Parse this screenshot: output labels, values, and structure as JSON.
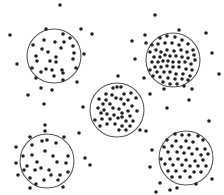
{
  "diagram": {
    "type": "cluster-sampling-illustration",
    "colors": {
      "background": "#ffffff",
      "circle_stroke": "#555555",
      "dot": "#222222"
    },
    "dot_radius": 1.8,
    "clusters": [
      {
        "name": "top-left",
        "cx": 54,
        "cy": 56,
        "r": 27,
        "density": "sparse",
        "dots": [
          [
            46,
            29
          ],
          [
            63,
            34
          ],
          [
            70,
            38
          ],
          [
            44,
            40
          ],
          [
            55,
            42
          ],
          [
            64,
            42
          ],
          [
            33,
            45
          ],
          [
            42,
            49
          ],
          [
            48,
            52
          ],
          [
            61,
            48
          ],
          [
            73,
            46
          ],
          [
            74,
            53
          ],
          [
            36,
            56
          ],
          [
            37,
            61
          ],
          [
            50,
            61
          ],
          [
            56,
            57
          ],
          [
            73,
            59
          ],
          [
            56,
            62
          ],
          [
            32,
            68
          ],
          [
            46,
            69
          ],
          [
            52,
            70
          ],
          [
            62,
            70
          ],
          [
            76,
            68
          ],
          [
            41,
            72
          ],
          [
            63,
            73
          ],
          [
            54,
            76
          ]
        ]
      },
      {
        "name": "top-right",
        "cx": 173,
        "cy": 60,
        "r": 27,
        "density": "dense",
        "dots": [
          [
            160,
            38
          ],
          [
            167,
            36
          ],
          [
            175,
            37
          ],
          [
            182,
            40
          ],
          [
            152,
            45
          ],
          [
            158,
            44
          ],
          [
            165,
            43
          ],
          [
            172,
            43
          ],
          [
            179,
            45
          ],
          [
            188,
            44
          ],
          [
            193,
            50
          ],
          [
            150,
            52
          ],
          [
            156,
            50
          ],
          [
            161,
            52
          ],
          [
            167,
            50
          ],
          [
            174,
            51
          ],
          [
            181,
            50
          ],
          [
            187,
            52
          ],
          [
            194,
            55
          ],
          [
            154,
            57
          ],
          [
            160,
            57
          ],
          [
            165,
            55
          ],
          [
            170,
            56
          ],
          [
            176,
            56
          ],
          [
            182,
            57
          ],
          [
            188,
            58
          ],
          [
            195,
            60
          ],
          [
            152,
            62
          ],
          [
            158,
            62
          ],
          [
            163,
            61
          ],
          [
            168,
            61
          ],
          [
            173,
            62
          ],
          [
            179,
            62
          ],
          [
            185,
            62
          ],
          [
            191,
            64
          ],
          [
            155,
            67
          ],
          [
            161,
            67
          ],
          [
            167,
            66
          ],
          [
            173,
            67
          ],
          [
            179,
            67
          ],
          [
            186,
            69
          ],
          [
            192,
            70
          ],
          [
            150,
            70
          ],
          [
            157,
            72
          ],
          [
            164,
            72
          ],
          [
            170,
            72
          ],
          [
            176,
            74
          ],
          [
            183,
            74
          ],
          [
            190,
            76
          ],
          [
            153,
            76
          ],
          [
            160,
            77
          ],
          [
            168,
            78
          ],
          [
            175,
            79
          ],
          [
            182,
            79
          ],
          [
            188,
            80
          ],
          [
            163,
            82
          ],
          [
            170,
            84
          ],
          [
            177,
            84
          ],
          [
            184,
            86
          ]
        ]
      },
      {
        "name": "center",
        "cx": 117,
        "cy": 110,
        "r": 27,
        "density": "medium",
        "dots": [
          [
            113,
            88
          ],
          [
            117,
            87
          ],
          [
            121,
            87
          ],
          [
            106,
            94
          ],
          [
            112,
            95
          ],
          [
            124,
            94
          ],
          [
            131,
            93
          ],
          [
            99,
            99
          ],
          [
            106,
            100
          ],
          [
            116,
            98
          ],
          [
            121,
            99
          ],
          [
            128,
            100
          ],
          [
            136,
            98
          ],
          [
            103,
            104
          ],
          [
            110,
            104
          ],
          [
            124,
            104
          ],
          [
            132,
            106
          ],
          [
            98,
            108
          ],
          [
            104,
            110
          ],
          [
            113,
            108
          ],
          [
            119,
            109
          ],
          [
            128,
            111
          ],
          [
            137,
            111
          ],
          [
            101,
            113
          ],
          [
            107,
            114
          ],
          [
            114,
            115
          ],
          [
            122,
            113
          ],
          [
            130,
            116
          ],
          [
            102,
            119
          ],
          [
            110,
            119
          ],
          [
            118,
            118
          ],
          [
            126,
            121
          ],
          [
            133,
            121
          ],
          [
            107,
            124
          ],
          [
            115,
            124
          ],
          [
            122,
            126
          ],
          [
            130,
            126
          ],
          [
            100,
            126
          ],
          [
            119,
            130
          ],
          [
            126,
            130
          ]
        ]
      },
      {
        "name": "bottom-left",
        "cx": 47,
        "cy": 161,
        "r": 27,
        "density": "sparse",
        "dots": [
          [
            30,
            137
          ],
          [
            42,
            141
          ],
          [
            47,
            140
          ],
          [
            56,
            143
          ],
          [
            64,
            137
          ],
          [
            32,
            145
          ],
          [
            23,
            156
          ],
          [
            32,
            155
          ],
          [
            45,
            151
          ],
          [
            53,
            156
          ],
          [
            68,
            156
          ],
          [
            27,
            166
          ],
          [
            37,
            162
          ],
          [
            57,
            162
          ],
          [
            66,
            163
          ],
          [
            24,
            170
          ],
          [
            35,
            170
          ],
          [
            41,
            168
          ],
          [
            49,
            170
          ],
          [
            51,
            175
          ],
          [
            60,
            175
          ],
          [
            68,
            172
          ],
          [
            30,
            178
          ],
          [
            44,
            180
          ],
          [
            58,
            180
          ],
          [
            36,
            184
          ]
        ]
      },
      {
        "name": "bottom-right",
        "cx": 186,
        "cy": 158,
        "r": 27,
        "density": "medium",
        "dots": [
          [
            175,
            134
          ],
          [
            182,
            135
          ],
          [
            189,
            135
          ],
          [
            198,
            136
          ],
          [
            167,
            140
          ],
          [
            176,
            141
          ],
          [
            186,
            141
          ],
          [
            193,
            142
          ],
          [
            203,
            140
          ],
          [
            164,
            147
          ],
          [
            172,
            146
          ],
          [
            181,
            147
          ],
          [
            189,
            148
          ],
          [
            197,
            149
          ],
          [
            205,
            149
          ],
          [
            168,
            152
          ],
          [
            177,
            152
          ],
          [
            184,
            153
          ],
          [
            192,
            154
          ],
          [
            201,
            155
          ],
          [
            208,
            154
          ],
          [
            161,
            159
          ],
          [
            170,
            159
          ],
          [
            178,
            159
          ],
          [
            186,
            160
          ],
          [
            195,
            161
          ],
          [
            203,
            160
          ],
          [
            165,
            164
          ],
          [
            173,
            165
          ],
          [
            182,
            165
          ],
          [
            190,
            166
          ],
          [
            198,
            166
          ],
          [
            206,
            166
          ],
          [
            168,
            171
          ],
          [
            176,
            171
          ],
          [
            185,
            171
          ],
          [
            194,
            172
          ],
          [
            201,
            172
          ],
          [
            172,
            177
          ],
          [
            180,
            177
          ],
          [
            190,
            177
          ]
        ]
      }
    ],
    "scattered_dots": [
      [
        60,
        5
      ],
      [
        10,
        35
      ],
      [
        81,
        29
      ],
      [
        92,
        34
      ],
      [
        17,
        64
      ],
      [
        84,
        54
      ],
      [
        36,
        78
      ],
      [
        41,
        88
      ],
      [
        52,
        90
      ],
      [
        28,
        95
      ],
      [
        77,
        82
      ],
      [
        63,
        80
      ],
      [
        155,
        15
      ],
      [
        145,
        35
      ],
      [
        146,
        43
      ],
      [
        132,
        41
      ],
      [
        135,
        59
      ],
      [
        179,
        30
      ],
      [
        206,
        33
      ],
      [
        212,
        53
      ],
      [
        219,
        74
      ],
      [
        144,
        78
      ],
      [
        118,
        76
      ],
      [
        192,
        89
      ],
      [
        164,
        89
      ],
      [
        150,
        94
      ],
      [
        44,
        104
      ],
      [
        45,
        125
      ],
      [
        45,
        131
      ],
      [
        83,
        107
      ],
      [
        16,
        147
      ],
      [
        16,
        163
      ],
      [
        18,
        175
      ],
      [
        90,
        165
      ],
      [
        79,
        133
      ],
      [
        85,
        158
      ],
      [
        30,
        188
      ],
      [
        63,
        187
      ],
      [
        189,
        100
      ],
      [
        167,
        108
      ],
      [
        209,
        121
      ],
      [
        146,
        131
      ],
      [
        122,
        117
      ],
      [
        152,
        150
      ],
      [
        177,
        188
      ],
      [
        212,
        179
      ],
      [
        150,
        167
      ],
      [
        160,
        183
      ],
      [
        170,
        190
      ],
      [
        156,
        192
      ],
      [
        196,
        184
      ],
      [
        95,
        120
      ],
      [
        140,
        130
      ]
    ]
  }
}
